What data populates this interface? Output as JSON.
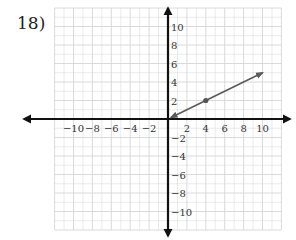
{
  "problem": {
    "number_label": "18)"
  },
  "colors": {
    "grid": "#d6d6d6",
    "axis": "#111111",
    "segment": "#5a5a5a",
    "point": "#555555",
    "label": "#333333"
  },
  "chart_data": {
    "type": "line",
    "title": "",
    "xlabel": "",
    "ylabel": "",
    "xlim": [
      -12,
      12
    ],
    "ylim": [
      -12,
      12
    ],
    "grid": true,
    "x_tick_labels": [
      "-10",
      "-8",
      "-6",
      "-4",
      "-2",
      "2",
      "4",
      "6",
      "8",
      "10"
    ],
    "y_tick_labels": [
      "10",
      "8",
      "6",
      "4",
      "2",
      "-2",
      "-4",
      "-6",
      "-8",
      "-10"
    ],
    "series": [
      {
        "name": "ray",
        "style": "arrow-both-ends",
        "points": [
          {
            "x": 0,
            "y": 0
          },
          {
            "x": 10,
            "y": 5
          }
        ],
        "marked_point": {
          "x": 4,
          "y": 2
        }
      }
    ],
    "axes_arrows": true
  }
}
